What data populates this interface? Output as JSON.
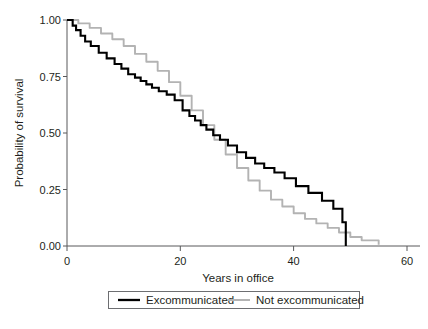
{
  "chart_data": {
    "type": "line",
    "subtype": "kaplan-meier-step",
    "title": "",
    "xlabel": "Years in office",
    "ylabel": "Probability of survival",
    "xlim": [
      0,
      60
    ],
    "ylim": [
      0,
      1
    ],
    "xticks": [
      0,
      20,
      40,
      60
    ],
    "xtick_labels": [
      "0",
      "20",
      "40",
      "60"
    ],
    "yticks": [
      0.0,
      0.25,
      0.5,
      0.75,
      1.0
    ],
    "ytick_labels": [
      "0.00",
      "0.25",
      "0.50",
      "0.75",
      "1.00"
    ],
    "grid": false,
    "legend_position": "bottom-center",
    "series": [
      {
        "name": "Excommunicated",
        "color": "#000000",
        "style": "step",
        "x": [
          0,
          1.0,
          1.6,
          2.4,
          3.2,
          4.2,
          5.6,
          7.0,
          8.4,
          9.6,
          10.8,
          12.0,
          13.0,
          14.0,
          15.0,
          16.2,
          17.6,
          19.0,
          20.4,
          21.6,
          22.6,
          23.6,
          24.6,
          25.8,
          27.0,
          28.4,
          30.0,
          31.6,
          33.2,
          34.8,
          36.6,
          38.4,
          40.4,
          42.6,
          45.0,
          47.0,
          48.6,
          49.2
        ],
        "y": [
          1.0,
          0.975,
          0.955,
          0.93,
          0.905,
          0.885,
          0.855,
          0.83,
          0.805,
          0.785,
          0.76,
          0.745,
          0.73,
          0.715,
          0.7,
          0.685,
          0.67,
          0.645,
          0.6,
          0.575,
          0.555,
          0.535,
          0.515,
          0.49,
          0.47,
          0.445,
          0.415,
          0.39,
          0.365,
          0.345,
          0.325,
          0.3,
          0.265,
          0.235,
          0.2,
          0.165,
          0.105,
          0.0
        ]
      },
      {
        "name": "Not excommunicated",
        "color": "#b3b3b3",
        "style": "step",
        "x": [
          0,
          2.0,
          4.0,
          6.0,
          8.0,
          10.0,
          12.0,
          14.0,
          16.0,
          18.0,
          20.0,
          22.0,
          24.0,
          26.0,
          28.0,
          30.0,
          32.0,
          34.0,
          36.0,
          38.0,
          40.0,
          42.0,
          44.0,
          46.0,
          48.0,
          50.0,
          52.0,
          55.0
        ],
        "y": [
          1.0,
          0.985,
          0.965,
          0.94,
          0.915,
          0.885,
          0.85,
          0.815,
          0.775,
          0.725,
          0.665,
          0.6,
          0.535,
          0.47,
          0.405,
          0.345,
          0.29,
          0.245,
          0.205,
          0.175,
          0.145,
          0.12,
          0.1,
          0.08,
          0.06,
          0.04,
          0.025,
          0.005
        ]
      }
    ],
    "legend_entries": [
      {
        "label": "Excommunicated",
        "color": "#000000"
      },
      {
        "label": "Not excommunicated",
        "color": "#b3b3b3"
      }
    ]
  },
  "axes": {
    "x_title": "Years in office",
    "y_title": "Probability of survival",
    "x_tick_labels": [
      "0",
      "20",
      "40",
      "60"
    ],
    "y_tick_labels": [
      "1.00",
      "0.75",
      "0.50",
      "0.25",
      "0.00"
    ]
  },
  "legend": {
    "entry_1_label": "Excommunicated",
    "entry_2_label": "Not excommunicated"
  },
  "colors": {
    "excommunicated": "#000000",
    "not_excommunicated": "#b3b3b3",
    "axis": "#58595b",
    "text": "#231f20",
    "background": "#ffffff"
  }
}
